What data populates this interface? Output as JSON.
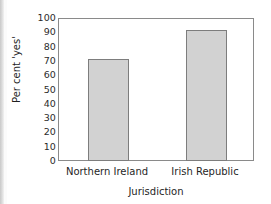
{
  "chart_data": {
    "type": "bar",
    "title": "",
    "xlabel": "Jurisdiction",
    "ylabel": "Per cent 'yes'",
    "categories": [
      "Northern Ireland",
      "Irish Republic"
    ],
    "values": [
      72,
      92.5
    ],
    "ylim": [
      0,
      100
    ],
    "ytick_labels": [
      "100",
      "90",
      "80",
      "70",
      "60",
      "50",
      "40",
      "30",
      "20",
      "10",
      "0"
    ],
    "ytick_values": [
      100,
      90,
      80,
      70,
      60,
      50,
      40,
      30,
      20,
      10,
      0
    ],
    "grid": false,
    "legend": false,
    "bar_fill_color": "#d2d2d2",
    "bar_border_color": "#7d7d7d",
    "frame_color": "#8a8a8a",
    "text_color": "#1f1f1f"
  },
  "axes": {
    "y_title": "Per cent 'yes'",
    "x_title": "Jurisdiction"
  }
}
